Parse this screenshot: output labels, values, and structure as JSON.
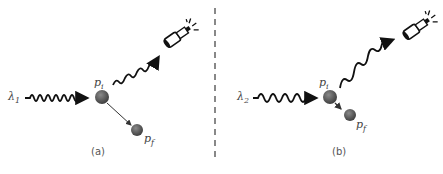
{
  "panels": [
    {
      "caption": "(a)",
      "incoming_label": "λ",
      "incoming_sub": "1",
      "initial_particle": "p",
      "initial_sub": "i",
      "final_particle": "p",
      "final_sub": "f",
      "detector_icon": "telescope-detector-icon"
    },
    {
      "caption": "(b)",
      "incoming_label": "λ",
      "incoming_sub": "2",
      "initial_particle": "p",
      "initial_sub": "i",
      "final_particle": "p",
      "final_sub": "f",
      "detector_icon": "telescope-detector-icon"
    }
  ],
  "colors": {
    "wave": "#111111",
    "particle": "#555555",
    "divider": "#888888"
  }
}
